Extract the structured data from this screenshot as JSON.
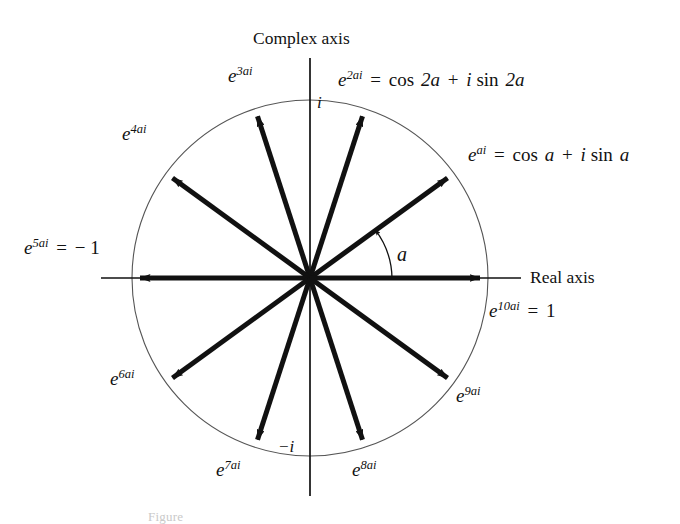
{
  "figure": {
    "caption": "Figure",
    "stroke_color": "#111111",
    "circle_color": "#555555",
    "background": "#ffffff"
  },
  "axes": {
    "complex_axis_label": "Complex axis",
    "real_axis_label": "Real axis",
    "imaginary_unit_positive": "i",
    "imaginary_unit_negative": "−i"
  },
  "angle": {
    "symbol": "a",
    "degrees": 36
  },
  "vectors": [
    {
      "index": 1,
      "angle_deg": 36,
      "exponent": "ai",
      "label_html": "e<sup>ai</sup> <span class=\"op\">=</span> <span class=\"fn\">cos</span> a <span class=\"op\">+</span> i <span class=\"fn\">sin</span> a",
      "label_text": "e^{ai} = cos a + i sin a"
    },
    {
      "index": 2,
      "angle_deg": 72,
      "exponent": "2ai",
      "label_html": "e<sup>2ai</sup> <span class=\"op\">=</span> <span class=\"fn\">cos</span> 2a <span class=\"op\">+</span> i <span class=\"fn\">sin</span> 2a",
      "label_text": "e^{2ai} = cos 2a + i sin 2a"
    },
    {
      "index": 3,
      "angle_deg": 108,
      "exponent": "3ai",
      "label_html": "e<sup>3ai</sup>",
      "label_text": "e^{3ai}"
    },
    {
      "index": 4,
      "angle_deg": 144,
      "exponent": "4ai",
      "label_html": "e<sup>4ai</sup>",
      "label_text": "e^{4ai}"
    },
    {
      "index": 5,
      "angle_deg": 180,
      "exponent": "5ai",
      "label_html": "e<sup>5ai</sup> <span class=\"op\">=</span> <span class=\"up\">− 1</span>",
      "label_text": "e^{5ai} = -1"
    },
    {
      "index": 6,
      "angle_deg": 216,
      "exponent": "6ai",
      "label_html": "e<sup>6ai</sup>",
      "label_text": "e^{6ai}"
    },
    {
      "index": 7,
      "angle_deg": 252,
      "exponent": "7ai",
      "label_html": "e<sup>7ai</sup>",
      "label_text": "e^{7ai}"
    },
    {
      "index": 8,
      "angle_deg": 288,
      "exponent": "8ai",
      "label_html": "e<sup>8ai</sup>",
      "label_text": "e^{8ai}"
    },
    {
      "index": 9,
      "angle_deg": 324,
      "exponent": "9ai",
      "label_html": "e<sup>9ai</sup>",
      "label_text": "e^{9ai}"
    },
    {
      "index": 10,
      "angle_deg": 360,
      "exponent": "10ai",
      "label_html": "e<sup>10ai</sup> <span class=\"op\">=</span> <span class=\"up\">1</span>",
      "label_text": "e^{10ai} = 1"
    }
  ],
  "chart_data": {
    "type": "scatter",
    "xlabel": "Real axis",
    "ylabel": "Complex axis",
    "xlim": [
      -1.25,
      1.25
    ],
    "ylim": [
      -1.25,
      1.25
    ],
    "grid": false,
    "legend": "none",
    "annotations": [
      "i",
      "−i",
      "a",
      "Real axis",
      "Complex axis"
    ],
    "unit_circle": {
      "center": [
        0,
        0
      ],
      "radius": 1
    },
    "angle_step_deg": 36,
    "series": [
      {
        "name": "e^{k a i} vectors",
        "points": [
          {
            "k": 1,
            "angle_deg": 36,
            "x": 0.809,
            "y": 0.588
          },
          {
            "k": 2,
            "angle_deg": 72,
            "x": 0.309,
            "y": 0.951
          },
          {
            "k": 3,
            "angle_deg": 108,
            "x": -0.309,
            "y": 0.951
          },
          {
            "k": 4,
            "angle_deg": 144,
            "x": -0.809,
            "y": 0.588
          },
          {
            "k": 5,
            "angle_deg": 180,
            "x": -1.0,
            "y": 0.0
          },
          {
            "k": 6,
            "angle_deg": 216,
            "x": -0.809,
            "y": -0.588
          },
          {
            "k": 7,
            "angle_deg": 252,
            "x": -0.309,
            "y": -0.951
          },
          {
            "k": 8,
            "angle_deg": 288,
            "x": 0.309,
            "y": -0.951
          },
          {
            "k": 9,
            "angle_deg": 324,
            "x": 0.809,
            "y": -0.588
          },
          {
            "k": 10,
            "angle_deg": 360,
            "x": 1.0,
            "y": 0.0
          }
        ]
      }
    ]
  }
}
